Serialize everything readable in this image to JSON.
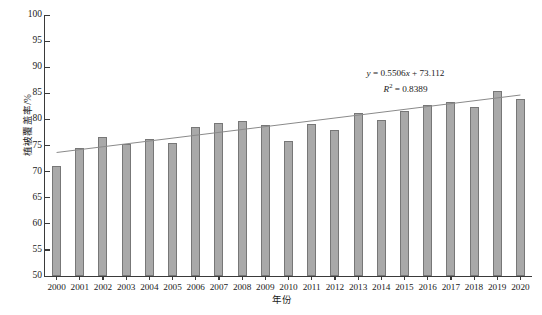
{
  "chart_data": {
    "type": "bar",
    "title": "",
    "xlabel": "年份",
    "ylabel": "植被覆盖率/%",
    "categories": [
      "2000",
      "2001",
      "2002",
      "2003",
      "2004",
      "2005",
      "2006",
      "2007",
      "2008",
      "2009",
      "2010",
      "2011",
      "2012",
      "2013",
      "2014",
      "2015",
      "2016",
      "2017",
      "2018",
      "2019",
      "2020"
    ],
    "values": [
      71.0,
      74.6,
      76.6,
      75.2,
      76.2,
      75.4,
      78.6,
      79.4,
      79.7,
      78.9,
      75.9,
      79.1,
      77.9,
      81.2,
      79.9,
      81.6,
      82.7,
      83.3,
      82.3,
      85.5,
      83.9
    ],
    "series": [
      {
        "name": "植被覆盖率",
        "values": [
          71.0,
          74.6,
          76.6,
          75.2,
          76.2,
          75.4,
          78.6,
          79.4,
          79.7,
          78.9,
          75.9,
          79.1,
          77.9,
          81.2,
          79.9,
          81.6,
          82.7,
          83.3,
          82.3,
          85.5,
          83.9
        ]
      }
    ],
    "ylim": [
      50,
      100
    ],
    "yticks": [
      50,
      55,
      60,
      65,
      70,
      75,
      80,
      85,
      90,
      95,
      100
    ],
    "ytick_labels": [
      "50",
      "55",
      "60",
      "65",
      "70",
      "75",
      "80",
      "85",
      "90",
      "95",
      "100"
    ],
    "grid": false,
    "legend": false,
    "trendline": {
      "type": "linear",
      "slope": 0.5506,
      "intercept": 73.112,
      "r_squared": 0.8389,
      "y_at_first_category": 73.66,
      "y_at_last_category": 84.67
    },
    "annotations": {
      "equation_line1_prefix": "y",
      "equation_line1_body": " = 0.5506",
      "equation_line1_var": "x",
      "equation_line1_suffix": " + 73.112",
      "equation_line2_prefix": "R",
      "equation_line2_exponent": "2",
      "equation_line2_suffix": " = 0.8389",
      "equation_full_line1": "y = 0.5506x + 73.112",
      "equation_full_line2": "R² = 0.8389"
    },
    "colors": {
      "bar_fill": "#a9a9a9",
      "bar_border": "#777777",
      "axis": "#3a3a3a",
      "trendline": "#8a8a8a",
      "text": "#1a1a1a",
      "background": "#ffffff"
    }
  }
}
